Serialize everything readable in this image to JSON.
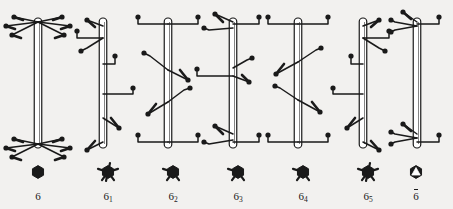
{
  "figure": {
    "background_color": "#f2f1ef",
    "stroke_color": "#1a1a1a",
    "rod_fill": "#ffffff",
    "width": 453,
    "height": 209,
    "columns": [
      {
        "id": "axis-6",
        "label": "6",
        "label_html": "6",
        "symbol": "filled-hexagon",
        "symbol_tails": 0,
        "overbar": false,
        "description": "6-fold rotation axis: six arms at top and six arms at bottom of the rod",
        "rod_x": 38,
        "rod_top": 18,
        "rod_bottom": 148,
        "symbol_x": 38,
        "label_x": 38,
        "arms_top": 6,
        "arms_bottom": 6,
        "mid_arms": 0
      },
      {
        "id": "axis-6-1",
        "label": "6 1",
        "label_html": "6<sub>1</sub>",
        "symbol": "filled-hexagon-with-tails",
        "symbol_tails": 6,
        "overbar": false,
        "description": "6-1 screw axis: arms distributed in a right-handed helix along the rod",
        "rod_x": 103,
        "rod_top": 18,
        "rod_bottom": 148,
        "symbol_x": 108,
        "label_x": 108,
        "arms_top": 1,
        "arms_bottom": 1,
        "mid_arms": 4
      },
      {
        "id": "axis-6-2",
        "label": "6 2",
        "label_html": "6<sub>2</sub>",
        "symbol": "filled-hexagon-with-tails",
        "symbol_tails": 2,
        "overbar": false,
        "description": "6-2 screw axis: paired horizontal arms top and bottom plus two helical pairs",
        "rod_x": 168,
        "rod_top": 18,
        "rod_bottom": 148,
        "symbol_x": 173,
        "label_x": 173,
        "arms_top": 2,
        "arms_bottom": 2,
        "mid_arms": 2
      },
      {
        "id": "axis-6-3",
        "label": "6 3",
        "label_html": "6<sub>3</sub>",
        "symbol": "filled-hexagon-with-tails",
        "symbol_tails": 2,
        "overbar": false,
        "description": "6-3 screw axis: three arms at top, three at bottom, two at mid height",
        "rod_x": 233,
        "rod_top": 18,
        "rod_bottom": 148,
        "symbol_x": 238,
        "label_x": 238,
        "arms_top": 3,
        "arms_bottom": 3,
        "mid_arms": 3
      },
      {
        "id": "axis-6-4",
        "label": "6 4",
        "label_html": "6<sub>4</sub>",
        "symbol": "filled-hexagon-with-tails",
        "symbol_tails": 2,
        "overbar": false,
        "description": "6-4 screw axis: left-handed helix, mirror of 6-2",
        "rod_x": 298,
        "rod_top": 18,
        "rod_bottom": 148,
        "symbol_x": 303,
        "label_x": 303,
        "arms_top": 2,
        "arms_bottom": 2,
        "mid_arms": 2
      },
      {
        "id": "axis-6-5",
        "label": "6 5",
        "label_html": "6<sub>5</sub>",
        "symbol": "filled-hexagon-with-tails",
        "symbol_tails": 6,
        "overbar": false,
        "description": "6-5 screw axis: left-handed helix, mirror of 6-1",
        "rod_x": 363,
        "rod_top": 18,
        "rod_bottom": 148,
        "symbol_x": 368,
        "label_x": 368,
        "arms_top": 1,
        "arms_bottom": 1,
        "mid_arms": 4
      },
      {
        "id": "axis-6-bar",
        "label": "6",
        "label_html": "6",
        "symbol": "hexagon-with-open-triangle",
        "symbol_tails": 0,
        "overbar": true,
        "description": "6-bar rotoinversion axis: three arms up-left and one right at top and bottom",
        "rod_x": 417,
        "rod_top": 18,
        "rod_bottom": 148,
        "symbol_x": 416,
        "label_x": 416,
        "arms_top": 4,
        "arms_bottom": 4,
        "mid_arms": 0
      }
    ]
  }
}
